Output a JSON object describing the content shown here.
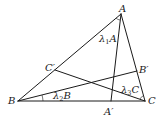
{
  "diagram": {
    "type": "triangle-cevians",
    "vertices": {
      "A": {
        "label": "A",
        "x": 121,
        "y": 14
      },
      "B": {
        "label": "B",
        "x": 18,
        "y": 101
      },
      "C": {
        "label": "C",
        "x": 145,
        "y": 101
      }
    },
    "cevian_feet": {
      "A_prime": {
        "label": "A′",
        "x": 111,
        "y": 101
      },
      "B_prime": {
        "label": "B′",
        "x": 137,
        "y": 71
      },
      "C_prime": {
        "label": "C′",
        "x": 55,
        "y": 70
      }
    },
    "angle_labels": {
      "lambda1": {
        "symbol": "λ",
        "sub": "1",
        "vertex": "A"
      },
      "lambda2": {
        "symbol": "λ",
        "sub": "2",
        "vertex": "B"
      },
      "lambda3": {
        "symbol": "λ",
        "sub": "3",
        "vertex": "C"
      }
    },
    "segments": [
      "AB",
      "BC",
      "CA",
      "AA′",
      "BB′",
      "CC′"
    ]
  }
}
